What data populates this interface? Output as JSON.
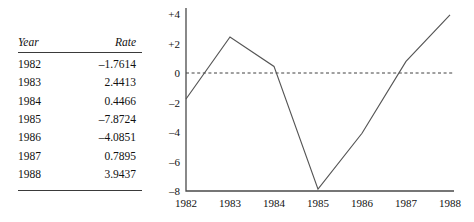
{
  "table": {
    "headers": [
      "Year",
      "Rate"
    ],
    "rows": [
      {
        "year": "1982",
        "rate": "–1.7614"
      },
      {
        "year": "1983",
        "rate": "2.4413"
      },
      {
        "year": "1984",
        "rate": "0.4466"
      },
      {
        "year": "1985",
        "rate": "–7.8724"
      },
      {
        "year": "1986",
        "rate": "–4.0851"
      },
      {
        "year": "1987",
        "rate": "0.7895"
      },
      {
        "year": "1988",
        "rate": "3.9437"
      }
    ]
  },
  "chart_data": {
    "type": "line",
    "title": "",
    "xlabel": "",
    "ylabel": "",
    "categories": [
      "1982",
      "1983",
      "1984",
      "1985",
      "1986",
      "1987",
      "1988"
    ],
    "values": [
      -1.7614,
      2.4413,
      0.4466,
      -7.8724,
      -4.0851,
      0.7895,
      3.9437
    ],
    "series": [
      {
        "name": "Rate",
        "values": [
          -1.7614,
          2.4413,
          0.4466,
          -7.8724,
          -4.0851,
          0.7895,
          3.9437
        ]
      }
    ],
    "ylim": [
      -8,
      4
    ],
    "yticks": [
      4,
      2,
      0,
      -2,
      -4,
      -6,
      -8
    ],
    "ytick_labels": [
      "+4",
      "+2",
      "0",
      "–2",
      "–4",
      "–6",
      "–8"
    ],
    "xtick_labels": [
      "1982",
      "1983",
      "1984",
      "1985",
      "1986",
      "1987",
      "1988"
    ],
    "grid": false,
    "legend": "none",
    "zero_reference_line": true,
    "zero_reference_style": "dashed"
  },
  "colors": {
    "line": "#555555",
    "axis": "#4a4a4a",
    "zero_line": "#2b2b2b",
    "text": "#111111",
    "rule": "#3a3a3a",
    "background": "#ffffff"
  }
}
